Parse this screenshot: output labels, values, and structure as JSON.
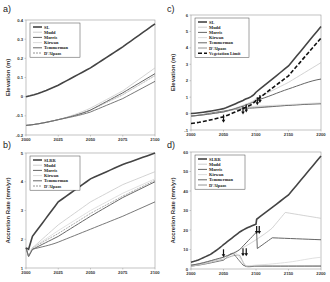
{
  "chart_data": [
    {
      "panel": "a",
      "type": "line",
      "title": "",
      "xlabel": "",
      "ylabel": "Elevation (m)",
      "xlim": [
        2000,
        2100
      ],
      "ylim": [
        -0.2,
        0.4
      ],
      "xticks": [
        "2000",
        "2025",
        "2050",
        "2075",
        "2100"
      ],
      "yticks": [
        "-0.2",
        "-0.1",
        "0",
        "0.1",
        "0.2",
        "0.3",
        "0.4"
      ],
      "grid": false,
      "legend_position": "upper left",
      "x": [
        2000,
        2025,
        2050,
        2075,
        2100
      ],
      "series": [
        {
          "name": "SL",
          "color": "#444444",
          "width": 1.6,
          "dash": "",
          "values": [
            0.0,
            0.06,
            0.15,
            0.26,
            0.38
          ]
        },
        {
          "name": "Mudd",
          "color": "#c8c8c8",
          "width": 0.8,
          "dash": "",
          "values": [
            -0.15,
            -0.12,
            -0.06,
            0.03,
            0.15
          ]
        },
        {
          "name": "Morris",
          "color": "#555555",
          "width": 0.8,
          "dash": "",
          "values": [
            -0.15,
            -0.12,
            -0.08,
            -0.01,
            0.08
          ]
        },
        {
          "name": "Kirwan",
          "color": "#d8d8d8",
          "width": 0.8,
          "dash": "",
          "values": [
            -0.15,
            -0.12,
            -0.07,
            0.01,
            0.11
          ]
        },
        {
          "name": "Temmerman",
          "color": "#666666",
          "width": 1.0,
          "dash": "",
          "values": [
            -0.15,
            -0.12,
            -0.07,
            0.02,
            0.12
          ]
        },
        {
          "name": "D'Alpaos",
          "color": "#888888",
          "width": 0.7,
          "dash": "2,1",
          "values": [
            -0.15,
            -0.12,
            -0.07,
            0.01,
            0.11
          ]
        }
      ]
    },
    {
      "panel": "b",
      "type": "line",
      "title": "",
      "xlabel": "",
      "ylabel": "Accretion Rate (mm/yr)",
      "xlim": [
        2000,
        2100
      ],
      "ylim": [
        1,
        5
      ],
      "xticks": [
        "2000",
        "2025",
        "2050",
        "2075",
        "2100"
      ],
      "yticks": [
        "1",
        "2",
        "3",
        "4",
        "5"
      ],
      "grid": false,
      "legend_position": "upper left",
      "x": [
        2000,
        2002,
        2005,
        2025,
        2050,
        2075,
        2100
      ],
      "series": [
        {
          "name": "SLRR",
          "color": "#444444",
          "width": 1.6,
          "dash": "",
          "values": [
            1.7,
            1.65,
            2.1,
            3.3,
            4.1,
            4.6,
            5.0
          ]
        },
        {
          "name": "Mudd",
          "color": "#c8c8c8",
          "width": 0.8,
          "dash": "",
          "values": [
            1.7,
            1.4,
            1.7,
            2.5,
            3.3,
            3.9,
            4.35
          ]
        },
        {
          "name": "Morris",
          "color": "#555555",
          "width": 0.8,
          "dash": "",
          "values": [
            1.7,
            1.4,
            1.65,
            1.9,
            2.35,
            2.8,
            3.3
          ]
        },
        {
          "name": "Kirwan",
          "color": "#d8d8d8",
          "width": 0.8,
          "dash": "",
          "values": [
            1.7,
            1.4,
            1.7,
            2.3,
            3.0,
            3.6,
            4.1
          ]
        },
        {
          "name": "Temmerman",
          "color": "#666666",
          "width": 1.0,
          "dash": "",
          "values": [
            1.7,
            1.4,
            1.65,
            2.1,
            2.8,
            3.45,
            4.0
          ]
        },
        {
          "name": "D'Alpaos",
          "color": "#888888",
          "width": 0.7,
          "dash": "2,1",
          "values": [
            1.7,
            1.4,
            1.7,
            2.2,
            2.9,
            3.5,
            4.05
          ]
        }
      ]
    },
    {
      "panel": "c",
      "type": "line",
      "title": "",
      "xlabel": "",
      "ylabel": "Elevation (m)",
      "xlim": [
        2000,
        2200
      ],
      "ylim": [
        -1,
        6
      ],
      "xticks": [
        "2000",
        "2050",
        "2100",
        "2150",
        "2200"
      ],
      "yticks": [
        "-1",
        "0",
        "1",
        "2",
        "3",
        "4",
        "5",
        "6"
      ],
      "grid": false,
      "legend_position": "upper left",
      "x": [
        2000,
        2050,
        2080,
        2100,
        2150,
        2200
      ],
      "series": [
        {
          "name": "SL",
          "color": "#444444",
          "width": 1.6,
          "dash": "",
          "values": [
            0.0,
            0.3,
            0.8,
            1.3,
            2.9,
            5.3
          ]
        },
        {
          "name": "Mudd",
          "color": "#c8c8c8",
          "width": 0.8,
          "dash": "",
          "values": [
            -0.15,
            0.1,
            0.5,
            0.9,
            1.9,
            3.1
          ]
        },
        {
          "name": "Morris",
          "color": "#555555",
          "width": 0.8,
          "dash": "",
          "values": [
            -0.15,
            0.15,
            0.3,
            0.35,
            0.5,
            0.6
          ]
        },
        {
          "name": "Kirwan",
          "color": "#d8d8d8",
          "width": 0.8,
          "dash": "",
          "values": [
            -0.15,
            0.1,
            0.35,
            0.45,
            0.55,
            0.65
          ]
        },
        {
          "name": "Temmerman",
          "color": "#666666",
          "width": 1.0,
          "dash": "",
          "values": [
            -0.15,
            0.1,
            0.45,
            0.8,
            1.5,
            2.1
          ]
        },
        {
          "name": "D'Alpaos",
          "color": "#888888",
          "width": 0.7,
          "dash": "",
          "values": [
            -0.15,
            0.1,
            0.35,
            0.4,
            0.5,
            0.6
          ]
        },
        {
          "name": "Vegetation Limit",
          "color": "#111111",
          "width": 1.6,
          "dash": "4,2",
          "values": [
            -0.6,
            -0.2,
            0.3,
            0.8,
            2.3,
            4.6
          ]
        }
      ],
      "annotations": [
        {
          "type": "arrow-down",
          "x": 2050,
          "label": ""
        },
        {
          "type": "arrow-down",
          "x": 2080,
          "label": ""
        },
        {
          "type": "arrow-down",
          "x": 2085,
          "label": ""
        },
        {
          "type": "arrow-down",
          "x": 2102,
          "label": ""
        },
        {
          "type": "arrow-down",
          "x": 2106,
          "label": ""
        }
      ]
    },
    {
      "panel": "d",
      "type": "line",
      "title": "",
      "xlabel": "",
      "ylabel": "Accretion Rate (mm/yr)",
      "xlim": [
        2000,
        2200
      ],
      "ylim": [
        0,
        60
      ],
      "xticks": [
        "2000",
        "2050",
        "2100",
        "2150",
        "2200"
      ],
      "yticks": [
        "0",
        "10",
        "20",
        "30",
        "40",
        "50",
        "60"
      ],
      "grid": false,
      "legend_position": "upper left",
      "series": [
        {
          "name": "SLRR",
          "color": "#444444",
          "width": 1.6,
          "dash": "",
          "x": [
            2000,
            2030,
            2050,
            2075,
            2100,
            2101,
            2150,
            2200
          ],
          "values": [
            3.5,
            7.5,
            12.5,
            19,
            23,
            25.5,
            38,
            58
          ]
        },
        {
          "name": "Mudd",
          "color": "#c8c8c8",
          "width": 0.8,
          "dash": "",
          "x": [
            2000,
            2050,
            2075,
            2100,
            2125,
            2145,
            2200
          ],
          "values": [
            2,
            6,
            10,
            15,
            21,
            29,
            26
          ]
        },
        {
          "name": "Morris",
          "color": "#555555",
          "width": 0.8,
          "dash": "",
          "x": [
            2000,
            2050,
            2065,
            2080,
            2100,
            2200
          ],
          "values": [
            1.5,
            4.5,
            8,
            2,
            1.5,
            1.5
          ]
        },
        {
          "name": "Kirwan",
          "color": "#d8d8d8",
          "width": 0.8,
          "dash": "",
          "x": [
            2000,
            2050,
            2070,
            2085,
            2100,
            2150,
            2200
          ],
          "values": [
            1.5,
            5,
            8,
            1.5,
            2,
            3.5,
            6
          ]
        },
        {
          "name": "Temmerman",
          "color": "#666666",
          "width": 1.0,
          "dash": "",
          "x": [
            2000,
            2050,
            2075,
            2101,
            2102,
            2125,
            2200
          ],
          "values": [
            2,
            6,
            10,
            19,
            10.5,
            16,
            15
          ]
        },
        {
          "name": "D'Alpaos",
          "color": "#888888",
          "width": 0.7,
          "dash": "",
          "x": [
            2000,
            2050,
            2075,
            2083,
            2100,
            2200
          ],
          "values": [
            1.5,
            5,
            7,
            1.5,
            1.5,
            1.5
          ]
        }
      ],
      "annotations": [
        {
          "type": "arrow-down",
          "x": 2050,
          "y": 6
        },
        {
          "type": "arrow-down",
          "x": 2080,
          "y": 6.5
        },
        {
          "type": "arrow-down",
          "x": 2085,
          "y": 6.5
        },
        {
          "type": "arrow-down",
          "x": 2101,
          "y": 18
        },
        {
          "type": "arrow-down",
          "x": 2105,
          "y": 18
        }
      ]
    }
  ],
  "panels": {
    "a": {
      "label": "a)",
      "ylabel": "Elevation (m)"
    },
    "b": {
      "label": "b)",
      "ylabel": "Accretion Rate (mm/yr)"
    },
    "c": {
      "label": "c)",
      "ylabel": "Elevation (m)"
    },
    "d": {
      "label": "d)",
      "ylabel": "Accretion Rate (mm/yr)"
    }
  }
}
